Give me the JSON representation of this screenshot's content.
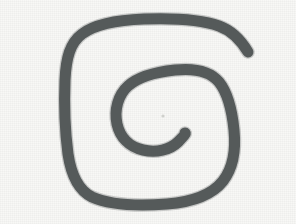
{
  "image": {
    "kind": "hand-drawn-sketch",
    "subject": "spiral",
    "title": "Hand-drawn spiral sketch",
    "alt_text": "A hand-drawn spiral with about two rounded-square turns, drawn in dark gray marker on off-white paper",
    "width": 296,
    "height": 224
  },
  "colors": {
    "background": "#f8f8f6",
    "stroke": "#555a5a",
    "stroke_soft": "#5f6464",
    "center_dot": "#cfd0cc"
  },
  "stroke": {
    "width": 11,
    "linecap": "round",
    "linejoin": "round"
  },
  "spiral": {
    "turns": 2,
    "direction": "counterclockwise-inward",
    "outer_loop": {
      "left": 67,
      "top": 21,
      "right": 233,
      "bottom": 203
    },
    "inner_loop": {
      "left": 119,
      "top": 74,
      "right": 224,
      "bottom": 145
    },
    "outer_terminus": {
      "x": 248,
      "y": 52
    },
    "inner_terminus": {
      "x": 185,
      "y": 133
    },
    "center_dot": {
      "x": 163,
      "y": 116,
      "radius": 1.6
    },
    "path_d": "M 248 52 C 242 42 233 31 219 26 C 200 19 172 18 144 19 C 118 20 95 24 82 34 C 70 43 66 58 65 80 C 64 104 65 131 68 154 C 71 174 78 190 92 197 C 110 205 140 206 167 204 C 192 202 212 195 223 181 C 233 168 236 150 234 130 C 232 110 227 92 219 82 C 210 71 194 68 175 70 C 156 72 138 77 128 86 C 118 95 114 110 117 124 C 120 137 129 147 143 150 C 156 153 170 150 178 142 C 185 135 186 133 185 133"
  },
  "layers": [
    {
      "name": "paper-background",
      "label": "Paper background"
    },
    {
      "name": "spiral-stroke",
      "label": "Spiral marker stroke"
    },
    {
      "name": "center-dot",
      "label": "Faint center dot"
    }
  ]
}
